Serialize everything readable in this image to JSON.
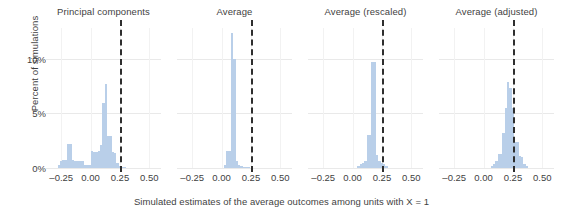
{
  "chart_data": {
    "type": "bar",
    "title": "",
    "xlabel": "Simulated estimates of the average outcomes among units with X = 1",
    "ylabel": "Percent of simulations",
    "xlim": [
      -0.38,
      0.6
    ],
    "ylim": [
      0,
      12.8
    ],
    "xticks": [
      -0.25,
      0.0,
      0.25,
      0.5
    ],
    "xtick_labels": [
      "–0.25",
      "0.00",
      "0.25",
      "0.50"
    ],
    "yticks": [
      0,
      5,
      10
    ],
    "ytick_labels": [
      "0%",
      "5%",
      "10%"
    ],
    "grid": "horizontal and vertical light gridlines",
    "legend": "none",
    "bar_color": "#b9cfe9",
    "refline_color": "#2e2e2e",
    "refline_style": "dashed",
    "refline_value": 0.25,
    "bin_width": 0.02,
    "annotation": "Dashed vertical line marks the true value 0.25 in every panel",
    "panels": [
      {
        "label": "Principal components",
        "bins": [
          -0.27,
          -0.25,
          -0.23,
          -0.21,
          -0.19,
          -0.17,
          -0.15,
          -0.13,
          -0.11,
          -0.09,
          -0.07,
          -0.05,
          -0.03,
          -0.01,
          0.01,
          0.03,
          0.05,
          0.07,
          0.09,
          0.11,
          0.13,
          0.15,
          0.17,
          0.19,
          0.21,
          0.23,
          0.25,
          0.27,
          0.29
        ],
        "values": [
          0.3,
          0.6,
          0.7,
          0.7,
          2.2,
          2.2,
          0.7,
          0.6,
          0.6,
          0.6,
          0.6,
          0.3,
          0.3,
          0.3,
          1.6,
          1.5,
          1.5,
          1.6,
          2.1,
          5.9,
          7.7,
          2.9,
          2.9,
          1.5,
          1.4,
          0.5,
          0.2,
          0.1,
          0.1
        ]
      },
      {
        "label": "Average",
        "bins": [
          0.03,
          0.05,
          0.07,
          0.09,
          0.11,
          0.13,
          0.15,
          0.17,
          0.19,
          0.21,
          0.23
        ],
        "values": [
          0.3,
          1.6,
          1.6,
          12.3,
          10.0,
          0.6,
          0.3,
          0.2,
          0.1,
          0.1,
          0.1
        ]
      },
      {
        "label": "Average (rescaled)",
        "bins": [
          0.05,
          0.07,
          0.09,
          0.11,
          0.13,
          0.15,
          0.17,
          0.19,
          0.21,
          0.23,
          0.25,
          0.27,
          0.29
        ],
        "values": [
          0.2,
          0.4,
          0.5,
          0.6,
          3.0,
          3.0,
          9.7,
          9.7,
          1.2,
          0.6,
          0.5,
          0.4,
          0.2
        ]
      },
      {
        "label": "Average (adjusted)",
        "bins": [
          0.07,
          0.09,
          0.11,
          0.13,
          0.15,
          0.17,
          0.19,
          0.21,
          0.23,
          0.25,
          0.27,
          0.29,
          0.31,
          0.33,
          0.35,
          0.37
        ],
        "values": [
          0.2,
          0.4,
          0.6,
          1.3,
          1.3,
          3.2,
          5.5,
          7.9,
          7.3,
          5.5,
          2.4,
          2.4,
          1.1,
          1.0,
          0.4,
          0.2
        ]
      }
    ]
  }
}
